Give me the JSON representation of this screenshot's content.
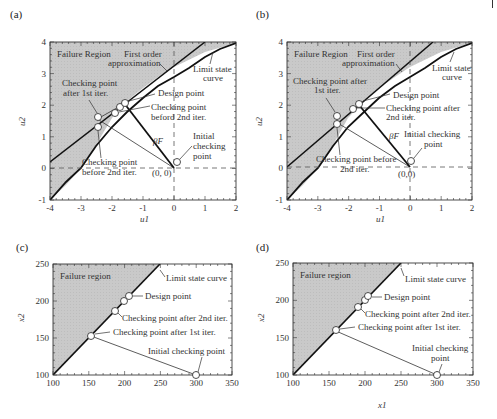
{
  "panels": [
    {
      "id": "a",
      "label": "(a)",
      "xlabel": "u1",
      "ylabel": "u2",
      "xticks": [
        "-4",
        "-3",
        "-2",
        "-1",
        "0",
        "1",
        "2"
      ],
      "yticks": [
        "-1",
        "0",
        "1",
        "2",
        "3",
        "4"
      ],
      "annotations": {
        "failure_region": "Failure Region",
        "first_order_1": "First order",
        "first_order_2": "approximation",
        "limit_state_1": "Limit state",
        "limit_state_2": "curve",
        "after_first_1": "Checking point",
        "after_first_2": "after 1st iter.",
        "design_point": "Design point",
        "before_second_a_1": "Checking point",
        "before_second_a_2": "beford 2nd iter.",
        "beta": "βF",
        "initial_1": "Initial",
        "initial_2": "checking",
        "initial_3": "point",
        "before_second_b_1": "Checking point",
        "before_second_b_2": "before 2nd iter.",
        "origin": "(0, 0)"
      }
    },
    {
      "id": "b",
      "label": "(b)",
      "xlabel": "u1",
      "ylabel": "u2",
      "xticks": [
        "-4",
        "-3",
        "-2",
        "-1",
        "0",
        "1",
        "2"
      ],
      "yticks": [
        "-1",
        "0",
        "1",
        "2",
        "3",
        "4"
      ],
      "annotations": {
        "failure_region": "Failure Region",
        "first_order_1": "First order",
        "first_order_2": "approximation",
        "limit_state_1": "Limit state",
        "limit_state_2": "curve",
        "after_first_1": "Checking point after",
        "after_first_2": "1st iter.",
        "design_point": "Design point",
        "after_second_1": "Checking point after",
        "after_second_2": "2nd iter.",
        "beta": "βF",
        "initial_1": "Initial checking",
        "initial_2": "point",
        "before_second_1": "Checking point before",
        "before_second_2": "2nd iter.",
        "origin": "(0,0)"
      }
    },
    {
      "id": "c",
      "label": "(c)",
      "xlabel": "",
      "ylabel": "x2",
      "xticks": [
        "100",
        "150",
        "200",
        "250",
        "300",
        "350"
      ],
      "yticks": [
        "100",
        "150",
        "200",
        "250"
      ],
      "annotations": {
        "failure_region": "Failure region",
        "limit_state": "Limit state curve",
        "design_point": "Design point",
        "after_second": "Checking point after 2nd iter.",
        "after_first": "Checking point after 1st iter.",
        "initial": "Initial checking point"
      }
    },
    {
      "id": "d",
      "label": "(d)",
      "xlabel": "x1",
      "ylabel": "x2",
      "xticks": [
        "100",
        "150",
        "200",
        "250",
        "300",
        "350"
      ],
      "yticks": [
        "100",
        "150",
        "200",
        "250"
      ],
      "annotations": {
        "failure_region": "Failure region",
        "limit_state": "Limit state curve",
        "design_point": "Design point",
        "after_second": "Checking point after 2nd iter.",
        "after_first": "Checking point after 1st iter.",
        "initial_1": "Initial checking",
        "initial_2": "point"
      }
    }
  ],
  "chart_data": [
    {
      "type": "line",
      "title": "(a)",
      "xlabel": "u1",
      "ylabel": "u2",
      "xlim": [
        -4,
        2
      ],
      "ylim": [
        -1,
        4
      ],
      "grid": false,
      "series": [
        {
          "name": "Limit state curve",
          "x": [
            -4,
            -3.5,
            -3,
            -2.5,
            -2,
            -1.5,
            -1,
            -0.5,
            0,
            0.5,
            1,
            1.5,
            2
          ],
          "y": [
            -1,
            0,
            0.72,
            1.3,
            1.78,
            2.2,
            2.57,
            2.9,
            3.2,
            3.45,
            3.65,
            3.82,
            3.95
          ]
        },
        {
          "name": "First order approximation",
          "x": [
            -4,
            1
          ],
          "y": [
            0.2,
            4
          ]
        },
        {
          "name": "Checking points",
          "points": [
            {
              "label": "Initial checking point",
              "x": 0,
              "y": 0.2
            },
            {
              "label": "Checking point after 1st iter.",
              "x": -2.4,
              "y": 1.6
            },
            {
              "label": "Checking point before 2nd iter.",
              "x": -2.4,
              "y": 1.3
            },
            {
              "label": "Checking point beford 2nd iter.",
              "x": -1.9,
              "y": 1.75
            },
            {
              "label": "Checking point",
              "x": -1.75,
              "y": 1.95
            },
            {
              "label": "Design point",
              "x": -1.6,
              "y": 2.05
            }
          ]
        }
      ],
      "annotations": [
        "Failure Region",
        "First order approximation",
        "Limit state curve",
        "βF",
        "(0, 0)"
      ]
    },
    {
      "type": "line",
      "title": "(b)",
      "xlabel": "u1",
      "ylabel": "u2",
      "xlim": [
        -4,
        2
      ],
      "ylim": [
        -1,
        4
      ],
      "grid": false,
      "series": [
        {
          "name": "Limit state curve",
          "x": [
            -4,
            -3.5,
            -3,
            -2.5,
            -2,
            -1.5,
            -1,
            -0.5,
            0,
            0.5,
            1,
            1.5,
            2
          ],
          "y": [
            -1,
            0,
            0.72,
            1.3,
            1.78,
            2.2,
            2.57,
            2.9,
            3.2,
            3.45,
            3.65,
            3.82,
            3.95
          ]
        },
        {
          "name": "First order approximation",
          "x": [
            -4,
            0.7
          ],
          "y": [
            0.05,
            4
          ]
        },
        {
          "name": "Checking points",
          "points": [
            {
              "label": "Initial checking point",
              "x": 0,
              "y": 0.2
            },
            {
              "label": "Checking point after 1st iter.",
              "x": -2.4,
              "y": 1.6
            },
            {
              "label": "Checking point before 2nd iter.",
              "x": -2.4,
              "y": 1.35
            },
            {
              "label": "Checking point after 2nd iter.",
              "x": -1.85,
              "y": 1.82
            },
            {
              "label": "Design point",
              "x": -1.65,
              "y": 1.98
            }
          ]
        }
      ],
      "annotations": [
        "Failure Region",
        "First order approximation",
        "Limit state curve",
        "βF",
        "(0,0)"
      ]
    },
    {
      "type": "line",
      "title": "(c)",
      "xlabel": "",
      "ylabel": "x2",
      "xlim": [
        100,
        350
      ],
      "ylim": [
        100,
        250
      ],
      "grid": false,
      "series": [
        {
          "name": "Limit state curve",
          "x": [
            100,
            250
          ],
          "y": [
            100,
            250
          ]
        },
        {
          "name": "Checking points",
          "points": [
            {
              "label": "Initial checking point",
              "x": 298,
              "y": 100
            },
            {
              "label": "Checking point after 1st iter.",
              "x": 153,
              "y": 153
            },
            {
              "label": "Checking point after 2nd iter.",
              "x": 186,
              "y": 186
            },
            {
              "label": "Checking point",
              "x": 199,
              "y": 199
            },
            {
              "label": "Design point",
              "x": 205,
              "y": 205
            }
          ]
        }
      ],
      "annotations": [
        "Failure region"
      ]
    },
    {
      "type": "line",
      "title": "(d)",
      "xlabel": "x1",
      "ylabel": "x2",
      "xlim": [
        100,
        350
      ],
      "ylim": [
        100,
        250
      ],
      "grid": false,
      "series": [
        {
          "name": "Limit state curve",
          "x": [
            100,
            250
          ],
          "y": [
            100,
            250
          ]
        },
        {
          "name": "Checking points",
          "points": [
            {
              "label": "Initial checking point",
              "x": 298,
              "y": 100
            },
            {
              "label": "Checking point after 1st iter.",
              "x": 158,
              "y": 158
            },
            {
              "label": "Checking point after 2nd iter.",
              "x": 189,
              "y": 189
            },
            {
              "label": "Checking point",
              "x": 198,
              "y": 198
            },
            {
              "label": "Design point",
              "x": 203,
              "y": 203
            }
          ]
        }
      ],
      "annotations": [
        "Failure region"
      ]
    }
  ]
}
